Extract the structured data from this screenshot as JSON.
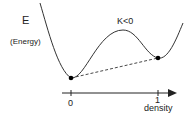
{
  "diagram": {
    "y_label": "E",
    "y_label_sub": "(Energy)",
    "curve_label": "K<0",
    "x_axis": {
      "label": "density",
      "ticks": [
        "0",
        "1"
      ]
    },
    "points": [
      {
        "name": "minimum-at-0",
        "x_value": "0"
      },
      {
        "name": "local-minimum-at-1",
        "x_value": "1"
      }
    ],
    "connector": "dashed line between the two minima",
    "colors": {
      "curve": "#333333",
      "axis": "#222222",
      "points": "#000000"
    }
  }
}
